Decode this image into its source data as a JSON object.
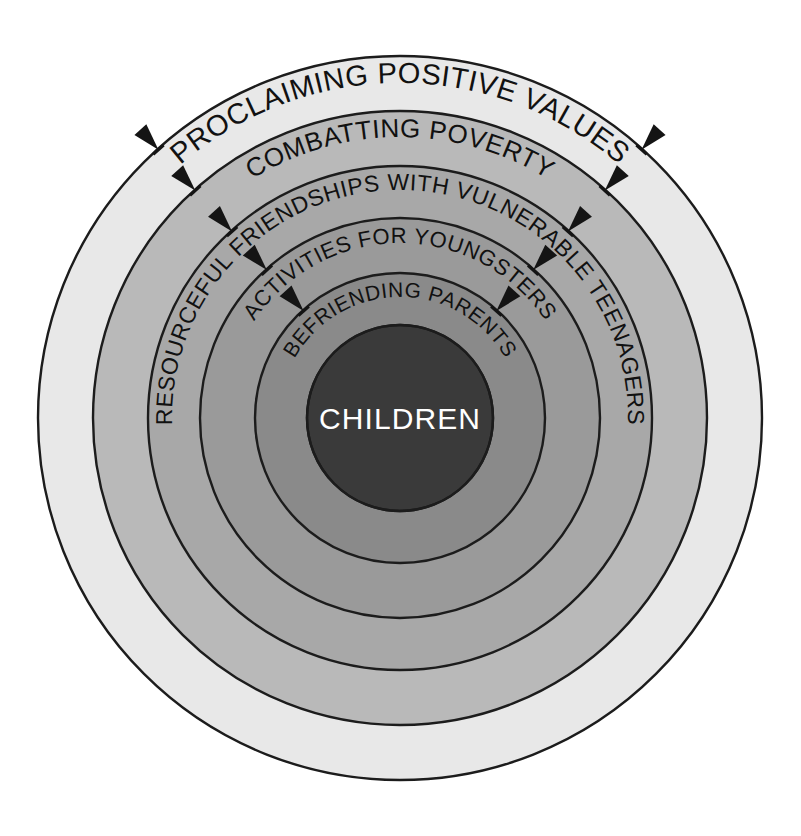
{
  "diagram": {
    "center": {
      "label": "CHILDREN",
      "color": "#3a3a3a",
      "text_color": "#ffffff",
      "radius": 93
    },
    "geometry": {
      "cx": 400,
      "cy": 418,
      "outer_radius": 362,
      "boundary_radii": [
        362,
        307,
        252,
        200,
        145,
        93
      ]
    },
    "rings": [
      {
        "index": 1,
        "label": "PROCLAIMING POSITIVE VALUES",
        "color": "#e8e8e8",
        "outer_radius": 362,
        "inner_radius": 307,
        "font_size": 29,
        "text_radius": 335
      },
      {
        "index": 2,
        "label": "COMBATTING POVERTY",
        "color": "#b9b9b9",
        "outer_radius": 307,
        "inner_radius": 252,
        "font_size": 26,
        "text_radius": 281
      },
      {
        "index": 3,
        "label": "RESOURCEFUL FRIENDSHIPS WITH VULNERABLE TEENAGERS",
        "color": "#a8a8a8",
        "outer_radius": 252,
        "inner_radius": 200,
        "font_size": 23,
        "text_radius": 228
      },
      {
        "index": 4,
        "label": "ACTIVITIES FOR YOUNGSTERS",
        "color": "#9a9a9a",
        "outer_radius": 200,
        "inner_radius": 145,
        "font_size": 22,
        "text_radius": 175
      },
      {
        "index": 5,
        "label": "BEFRIENDING PARENTS",
        "color": "#8a8a8a",
        "outer_radius": 145,
        "inner_radius": 93,
        "font_size": 21,
        "text_radius": 121
      }
    ],
    "arrows": {
      "description": "inward-pointing arrowheads crossing each ring boundary",
      "direction": "inward",
      "color": "#141414",
      "angles_deg": [
        228,
        312
      ],
      "crossing_radii": [
        362,
        307,
        252,
        200,
        145,
        93
      ],
      "count_per_angle": 5
    },
    "background_color": "#ffffff",
    "outline_color": "#1c1c1c"
  }
}
